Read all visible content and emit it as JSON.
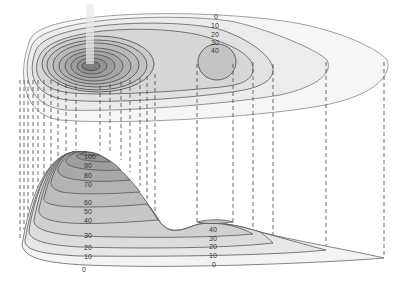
{
  "diagram": {
    "type": "topographic-map-with-profile",
    "colors": {
      "background": "#ffffff",
      "contour_line": "#555555",
      "projection_line": "#444444",
      "fill_levels": [
        "#f4f4f4",
        "#e9e9e9",
        "#dedede",
        "#d2d2d2",
        "#c7c7c7",
        "#bcbcbc",
        "#b1b1b1",
        "#a7a7a7",
        "#9c9c9c",
        "#929292",
        "#7f7f7f"
      ]
    },
    "plan_view": {
      "description": "Contour map of terrain seen from above",
      "contour_labels": [
        "0",
        "10",
        "20",
        "30",
        "40"
      ],
      "main_peak": "large summit at left with concentric contours",
      "secondary_peak": "small hill at 40 level on right"
    },
    "profile_view": {
      "description": "Cross-section profile derived by projecting contour intersections downward",
      "main_peak_labels": [
        "100",
        "90",
        "80",
        "70",
        "60",
        "50",
        "40",
        "30",
        "20",
        "10",
        "0"
      ],
      "secondary_peak_labels": [
        "40",
        "30",
        "20",
        "10",
        "0"
      ]
    }
  }
}
